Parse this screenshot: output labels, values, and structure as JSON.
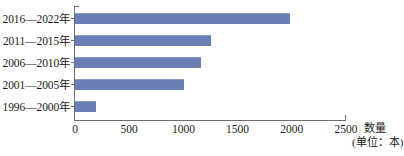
{
  "chart_data": {
    "type": "bar",
    "orientation": "horizontal",
    "title": "",
    "xlabel": "数量",
    "xlabel_unit": "(单位：本)",
    "ylabel": "",
    "categories": [
      "2016—2022年",
      "2011—2015年",
      "2006—2010年",
      "2001—2005年",
      "1996—2000年"
    ],
    "values": [
      1980,
      1250,
      1160,
      1010,
      190
    ],
    "xlim": [
      0,
      2500
    ],
    "xticks": [
      0,
      500,
      1000,
      1500,
      2000,
      2500
    ],
    "xtick_labels": [
      "0",
      "500",
      "1000",
      "1500",
      "2000",
      "2500"
    ],
    "grid": false,
    "legend": false,
    "series": [
      {
        "name": "数量",
        "color": "#6b7fb5",
        "values": [
          1980,
          1250,
          1160,
          1010,
          190
        ]
      }
    ]
  },
  "colors": {
    "bar": "#6b7fb5",
    "bar_highlight": "#8a9bc8",
    "axis": "#6e6e6e",
    "text": "#1a1a1a",
    "background": "#ffffff"
  }
}
